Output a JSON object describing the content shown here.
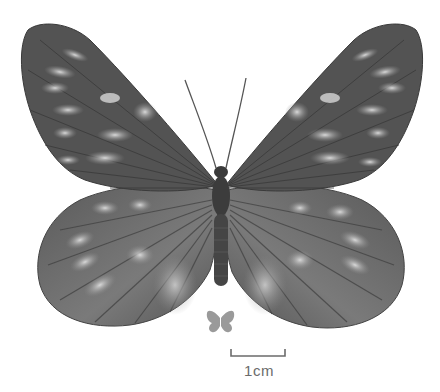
{
  "image": {
    "subject": "butterfly specimen, dorsal view",
    "colors": {
      "background": "#ffffff",
      "wing_dark": "#4a4a4a",
      "wing_mid": "#6e6e6e",
      "spot_light": "#c9c9c9",
      "body": "#3a3a3a",
      "silhouette": "#9a9a9a",
      "scale_bar": "#6b6b6b"
    }
  },
  "scale_bar": {
    "label": "1cm"
  },
  "icons": {
    "size_reference": "butterfly-silhouette-icon"
  }
}
